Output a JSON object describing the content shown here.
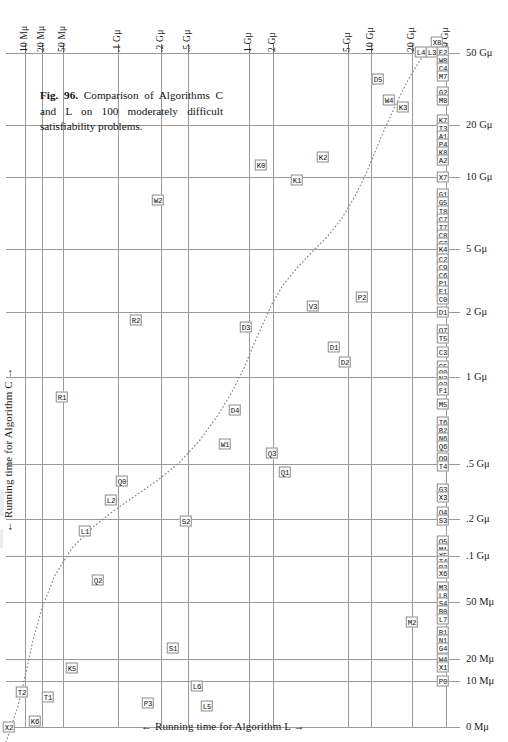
{
  "figure": {
    "caption_bold": "Fig. 96.",
    "caption_text": " Comparison of Algorithms C and L on 100 moderately difficult satisfiability problems."
  },
  "axes": {
    "x_caption": "← Running time for Algorithm L →",
    "y_caption": "← Running time for Algorithm C →",
    "top_ticks": [
      {
        "label": "10 Mμ",
        "x": 25
      },
      {
        "label": "20 Mμ",
        "x": 42
      },
      {
        "label": "50 Mμ",
        "x": 63
      },
      {
        "label": ".1 Gμ",
        "x": 118
      },
      {
        "label": ".2 Gμ",
        "x": 161
      },
      {
        "label": ".5 Gμ",
        "x": 188
      },
      {
        "label": "1 Gμ",
        "x": 249
      },
      {
        "label": "2 Gμ",
        "x": 273
      },
      {
        "label": "5 Gμ",
        "x": 348
      },
      {
        "label": "10 Gμ",
        "x": 371
      },
      {
        "label": "20 Gμ",
        "x": 412
      },
      {
        "label": "50 Gμ",
        "x": 446
      }
    ],
    "right_ticks": [
      {
        "label": "50 Gμ",
        "y": 53
      },
      {
        "label": "20 Gμ",
        "y": 125
      },
      {
        "label": "10 Gμ",
        "y": 177
      },
      {
        "label": "5 Gμ",
        "y": 249
      },
      {
        "label": "2 Gμ",
        "y": 312
      },
      {
        "label": "1 Gμ",
        "y": 377
      },
      {
        "label": ".5 Gμ",
        "y": 464
      },
      {
        "label": ".2 Gμ",
        "y": 519
      },
      {
        "label": ".1 Gμ",
        "y": 556
      },
      {
        "label": "50 Mμ",
        "y": 602
      },
      {
        "label": "20 Mμ",
        "y": 659
      },
      {
        "label": "10 Mμ",
        "y": 681
      },
      {
        "label": "0 Mμ",
        "y": 727
      }
    ]
  },
  "chart_data": {
    "type": "scatter",
    "title": "Fig. 96. Comparison of Algorithms C and L on 100 moderately difficult satisfiability problems.",
    "xlabel": "← Running time for Algorithm L →",
    "ylabel": "← Running time for Algorithm C →",
    "x_scale": "log",
    "y_scale": "log",
    "x_tick_labels": [
      "10 Mμ",
      "20 Mμ",
      "50 Mμ",
      ".1 Gμ",
      ".2 Gμ",
      ".5 Gμ",
      "1 Gμ",
      "2 Gμ",
      "5 Gμ",
      "10 Gμ",
      "20 Gμ",
      "50 Gμ"
    ],
    "y_tick_labels": [
      "50 Gμ",
      "20 Gμ",
      "10 Gμ",
      "5 Gμ",
      "2 Gμ",
      "1 Gμ",
      ".5 Gμ",
      ".2 Gμ",
      ".1 Gμ",
      "50 Mμ",
      "20 Mμ",
      "10 Mμ",
      "0 Mμ"
    ],
    "grid": true,
    "legend": "none",
    "annotation": "dotted curve shows median/equal-time trend",
    "points": [
      {
        "label": "X8",
        "px": 437,
        "py": 42
      },
      {
        "label": "L4",
        "px": 421,
        "py": 52
      },
      {
        "label": "L3",
        "px": 432,
        "py": 52
      },
      {
        "label": "E2",
        "px": 443,
        "py": 52
      },
      {
        "label": "W8",
        "px": 443,
        "py": 60
      },
      {
        "label": "C4",
        "px": 443,
        "py": 68
      },
      {
        "label": "M7",
        "px": 443,
        "py": 76
      },
      {
        "label": "D5",
        "px": 378,
        "py": 79
      },
      {
        "label": "G2",
        "px": 443,
        "py": 92
      },
      {
        "label": "M8",
        "px": 443,
        "py": 100
      },
      {
        "label": "W4",
        "px": 389,
        "py": 100
      },
      {
        "label": "K3",
        "px": 403,
        "py": 107
      },
      {
        "label": "K7",
        "px": 443,
        "py": 120
      },
      {
        "label": "T3",
        "px": 443,
        "py": 128
      },
      {
        "label": "A1",
        "px": 443,
        "py": 136
      },
      {
        "label": "P4",
        "px": 443,
        "py": 144
      },
      {
        "label": "K8",
        "px": 443,
        "py": 152
      },
      {
        "label": "A2",
        "px": 443,
        "py": 160
      },
      {
        "label": "K0",
        "px": 261,
        "py": 165
      },
      {
        "label": "K2",
        "px": 323,
        "py": 157
      },
      {
        "label": "K1",
        "px": 297,
        "py": 180
      },
      {
        "label": "X7",
        "px": 443,
        "py": 177
      },
      {
        "label": "G1",
        "px": 443,
        "py": 194
      },
      {
        "label": "G5",
        "px": 443,
        "py": 202
      },
      {
        "label": "W2",
        "px": 158,
        "py": 200
      },
      {
        "label": "T8",
        "px": 443,
        "py": 211
      },
      {
        "label": "C7",
        "px": 443,
        "py": 219
      },
      {
        "label": "T7",
        "px": 443,
        "py": 227
      },
      {
        "label": "C8",
        "px": 443,
        "py": 235
      },
      {
        "label": "G7",
        "px": 443,
        "py": 243
      },
      {
        "label": "C1",
        "px": 443,
        "py": 251
      },
      {
        "label": "K4",
        "px": 443,
        "py": 249
      },
      {
        "label": "C2",
        "px": 443,
        "py": 259
      },
      {
        "label": "C9",
        "px": 443,
        "py": 267
      },
      {
        "label": "C6",
        "px": 443,
        "py": 275
      },
      {
        "label": "P1",
        "px": 443,
        "py": 283
      },
      {
        "label": "E1",
        "px": 443,
        "py": 291
      },
      {
        "label": "C0",
        "px": 443,
        "py": 299
      },
      {
        "label": "V3",
        "px": 313,
        "py": 306
      },
      {
        "label": "P2",
        "px": 362,
        "py": 297
      },
      {
        "label": "D1",
        "px": 443,
        "py": 312
      },
      {
        "label": "R2",
        "px": 136,
        "py": 320
      },
      {
        "label": "D3",
        "px": 246,
        "py": 327
      },
      {
        "label": "Q7",
        "px": 443,
        "py": 330
      },
      {
        "label": "T5",
        "px": 443,
        "py": 338
      },
      {
        "label": "C3",
        "px": 443,
        "py": 352
      },
      {
        "label": "D1b",
        "px": 334,
        "py": 347
      },
      {
        "label": "D2",
        "px": 345,
        "py": 362
      },
      {
        "label": "C5",
        "px": 443,
        "py": 366
      },
      {
        "label": "Q8",
        "px": 443,
        "py": 372
      },
      {
        "label": "N2",
        "px": 443,
        "py": 378
      },
      {
        "label": "Q2",
        "px": 443,
        "py": 384
      },
      {
        "label": "F1",
        "px": 443,
        "py": 390
      },
      {
        "label": "R1",
        "px": 62,
        "py": 397
      },
      {
        "label": "M5",
        "px": 443,
        "py": 404
      },
      {
        "label": "D4",
        "px": 235,
        "py": 410
      },
      {
        "label": "T6",
        "px": 443,
        "py": 422
      },
      {
        "label": "B2",
        "px": 443,
        "py": 430
      },
      {
        "label": "N6",
        "px": 443,
        "py": 438
      },
      {
        "label": "Q6",
        "px": 443,
        "py": 446
      },
      {
        "label": "W1",
        "px": 225,
        "py": 444
      },
      {
        "label": "Q3",
        "px": 272,
        "py": 453
      },
      {
        "label": "Q9",
        "px": 443,
        "py": 458
      },
      {
        "label": "T4",
        "px": 443,
        "py": 466
      },
      {
        "label": "Q1",
        "px": 285,
        "py": 472
      },
      {
        "label": "Q0",
        "px": 122,
        "py": 481
      },
      {
        "label": "G3",
        "px": 443,
        "py": 489
      },
      {
        "label": "X3",
        "px": 443,
        "py": 497
      },
      {
        "label": "L2",
        "px": 111,
        "py": 500
      },
      {
        "label": "Q4",
        "px": 443,
        "py": 512
      },
      {
        "label": "S3",
        "px": 443,
        "py": 520
      },
      {
        "label": "S2",
        "px": 186,
        "py": 521
      },
      {
        "label": "L1",
        "px": 85,
        "py": 531
      },
      {
        "label": "Q5",
        "px": 443,
        "py": 541
      },
      {
        "label": "M1",
        "px": 443,
        "py": 549
      },
      {
        "label": "X5",
        "px": 443,
        "py": 555
      },
      {
        "label": "T4b",
        "px": 443,
        "py": 561
      },
      {
        "label": "P2b",
        "px": 443,
        "py": 567
      },
      {
        "label": "X6",
        "px": 443,
        "py": 573
      },
      {
        "label": "Q2b",
        "px": 98,
        "py": 580
      },
      {
        "label": "M3",
        "px": 443,
        "py": 587
      },
      {
        "label": "L8",
        "px": 443,
        "py": 595
      },
      {
        "label": "S4",
        "px": 443,
        "py": 603
      },
      {
        "label": "B0",
        "px": 443,
        "py": 611
      },
      {
        "label": "L7",
        "px": 443,
        "py": 619
      },
      {
        "label": "M2",
        "px": 412,
        "py": 622
      },
      {
        "label": "B1",
        "px": 443,
        "py": 632
      },
      {
        "label": "N1",
        "px": 443,
        "py": 640
      },
      {
        "label": "G4",
        "px": 443,
        "py": 648
      },
      {
        "label": "S1",
        "px": 173,
        "py": 648
      },
      {
        "label": "W4b",
        "px": 443,
        "py": 659
      },
      {
        "label": "X1",
        "px": 443,
        "py": 667
      },
      {
        "label": "K5",
        "px": 72,
        "py": 668
      },
      {
        "label": "P0",
        "px": 443,
        "py": 681
      },
      {
        "label": "L6",
        "px": 197,
        "py": 686
      },
      {
        "label": "T2",
        "px": 22,
        "py": 692
      },
      {
        "label": "T1",
        "px": 48,
        "py": 697
      },
      {
        "label": "P3",
        "px": 148,
        "py": 703
      },
      {
        "label": "L5",
        "px": 207,
        "py": 706
      },
      {
        "label": "X2",
        "px": 9,
        "py": 727
      },
      {
        "label": "K6",
        "px": 35,
        "py": 721
      }
    ]
  },
  "grid": {
    "vlines": [
      25,
      42,
      63,
      118,
      161,
      188,
      249,
      273,
      348,
      371,
      412,
      446
    ],
    "hlines": [
      53,
      125,
      177,
      249,
      312,
      377,
      464,
      519,
      556,
      602,
      659,
      681,
      727
    ],
    "major_vlines": [
      25,
      42,
      63,
      118,
      161,
      188,
      249,
      273,
      348,
      371,
      412,
      446
    ],
    "major_hlines": [
      53,
      125,
      177,
      249,
      312,
      377,
      464,
      519,
      556,
      602,
      659,
      681,
      727
    ]
  },
  "curve": {
    "description": "dotted equal-running-time trend curve",
    "path": "M 6,742 L 18,706 L 26,672 L 33,640 L 42,608 L 55,575 L 72,548 L 92,528 L 112,512 L 135,496 L 158,480 L 180,462 L 200,440 L 218,415 L 232,392 L 244,368 L 254,344 L 263,324 L 272,304 L 283,285 L 297,268 L 312,252 L 328,236 L 342,218 L 354,198 L 365,176 L 375,152 L 385,128 L 396,104 L 408,80 L 420,60 L 432,46"
  }
}
